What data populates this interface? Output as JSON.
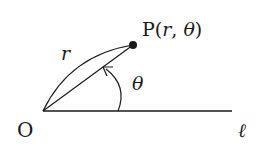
{
  "diagram": {
    "point_label": {
      "prefix": "P(",
      "r": "r",
      "sep": ", ",
      "theta": "θ",
      "suffix": ")"
    },
    "radius_label": "r",
    "angle_label": "θ",
    "origin_label": "O",
    "initial_line_label": "ℓ",
    "colors": {
      "stroke": "#1a1a1a",
      "background": "#ffffff"
    },
    "geometry": {
      "origin": [
        43,
        111
      ],
      "point": [
        133,
        45
      ],
      "line_end": [
        232,
        111
      ]
    }
  }
}
